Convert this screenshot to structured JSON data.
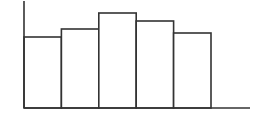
{
  "chart_data": {
    "type": "bar",
    "title": "",
    "xlabel": "",
    "ylabel": "",
    "categories": [
      "1",
      "2",
      "3",
      "4",
      "5"
    ],
    "values": [
      71,
      79,
      95,
      87,
      75
    ],
    "ylim": [
      0,
      108
    ],
    "grid": false,
    "legend": null,
    "bar_style": "outline, no gaps (histogram-like)"
  },
  "colors": {
    "stroke": "#333333",
    "fill": "#ffffff",
    "background": "#ffffff"
  }
}
